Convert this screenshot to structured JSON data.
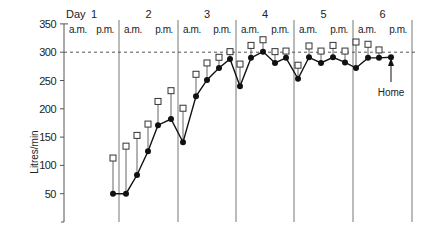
{
  "chart_data": {
    "type": "line",
    "title": "",
    "xlabel": "",
    "ylabel": "Litres/min",
    "ylim": [
      0,
      350
    ],
    "yticks": [
      50,
      100,
      150,
      200,
      250,
      300,
      350
    ],
    "reference_line": {
      "value": 300,
      "style": "dashed"
    },
    "grid": false,
    "header_label": "Day",
    "days": [
      {
        "label": "1",
        "periods": [
          "a.m.",
          "p.m."
        ]
      },
      {
        "label": "2",
        "periods": [
          "a.m.",
          "p.m."
        ]
      },
      {
        "label": "3",
        "periods": [
          "a.m.",
          "p.m."
        ]
      },
      {
        "label": "4",
        "periods": [
          "a.m.",
          "p.m."
        ]
      },
      {
        "label": "5",
        "periods": [
          "a.m.",
          "p.m."
        ]
      },
      {
        "label": "6",
        "periods": [
          "a.m.",
          "p.m."
        ]
      }
    ],
    "series": [
      {
        "name": "Pre-bronchodilator (filled circles)",
        "marker": "filled-circle",
        "values": [
          50,
          50,
          83,
          125,
          171,
          182,
          141,
          222,
          251,
          272,
          288,
          240,
          290,
          301,
          281,
          290,
          253,
          291,
          281,
          291,
          282,
          272,
          290,
          290,
          291
        ]
      },
      {
        "name": "Post-bronchodilator (open squares)",
        "marker": "open-square",
        "values": [
          113,
          134,
          153,
          173,
          213,
          232,
          201,
          261,
          281,
          291,
          301,
          279,
          312,
          322,
          301,
          302,
          277,
          311,
          302,
          312,
          302,
          318,
          314,
          304,
          null
        ]
      }
    ],
    "x_positions_px": [
      113,
      126,
      137,
      148,
      158,
      171,
      183,
      196,
      207,
      219,
      230,
      240,
      251,
      263,
      275,
      286,
      298,
      309,
      321,
      333,
      345,
      356,
      368,
      379,
      391
    ],
    "annotations": [
      {
        "text": "Home",
        "point_index": 24,
        "arrow": "up"
      }
    ]
  }
}
